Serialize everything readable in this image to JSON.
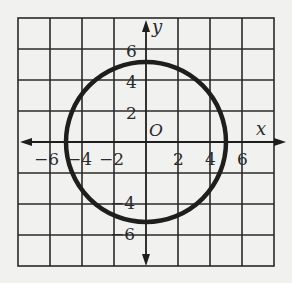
{
  "graph": {
    "axis_labels": {
      "x": "x",
      "y": "y",
      "origin": "O"
    },
    "x_ticks": [
      {
        "label": "−6",
        "value": -6
      },
      {
        "label": "−4",
        "value": -4
      },
      {
        "label": "−2",
        "value": -2
      },
      {
        "label": "2",
        "value": 2
      },
      {
        "label": "4",
        "value": 4
      },
      {
        "label": "6",
        "value": 6
      }
    ],
    "y_ticks": [
      {
        "label": "6",
        "value": 6
      },
      {
        "label": "4",
        "value": 4
      },
      {
        "label": "2",
        "value": 2
      },
      {
        "label": "−4",
        "value": -4
      },
      {
        "label": "−6",
        "value": -6
      }
    ],
    "circle": {
      "center_x": 0,
      "center_y": 0,
      "radius": 5,
      "equation": "x^2 + y^2 = 25"
    },
    "grid": {
      "xmin": -8,
      "xmax": 8,
      "ymin": -8,
      "ymax": 8,
      "step": 2
    },
    "colors": {
      "grid": "#2a2a2a",
      "curve": "#1e1e1e",
      "background": "#f1f1ef"
    }
  }
}
